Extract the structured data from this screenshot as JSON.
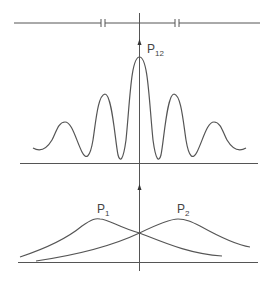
{
  "diagram": {
    "labels": {
      "combined": {
        "main": "P",
        "sub": "12"
      },
      "slit1": {
        "main": "P",
        "sub": "1"
      },
      "slit2": {
        "main": "P",
        "sub": "2"
      }
    },
    "colors": {
      "line": "#555555",
      "text": "#444444",
      "background": "#ffffff"
    },
    "elements": [
      "barrier-line-with-two-slits",
      "vertical-center-axis",
      "interference-pattern-P12",
      "baseline-upper",
      "single-slit-curve-P1",
      "single-slit-curve-P2",
      "baseline-lower"
    ]
  }
}
